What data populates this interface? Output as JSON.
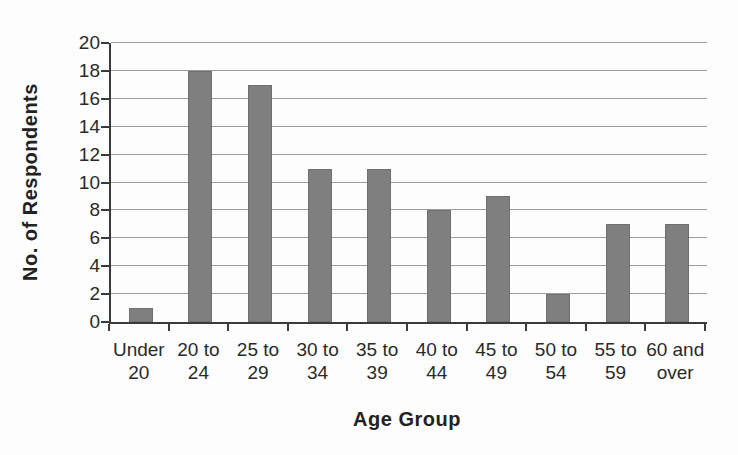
{
  "chart_data": {
    "type": "bar",
    "categories": [
      "Under 20",
      "20 to 24",
      "25 to 29",
      "30 to 34",
      "35 to 39",
      "40 to 44",
      "45 to 49",
      "50 to 54",
      "55 to 59",
      "60 and over"
    ],
    "values": [
      1,
      18,
      17,
      11,
      11,
      8,
      9,
      2,
      7,
      7
    ],
    "title": "",
    "xlabel": "Age Group",
    "ylabel": "No. of Respondents",
    "ylim": [
      0,
      20
    ],
    "ytick_step": 2,
    "yticks": [
      0,
      2,
      4,
      6,
      8,
      10,
      12,
      14,
      16,
      18,
      20
    ],
    "grid": "horizontal",
    "legend": "none",
    "bar_color": "#7f7f7f",
    "gridline_color": "#9c9c9c",
    "axis_color": "#3b3b3b",
    "text_color": "#2a2a2a"
  }
}
